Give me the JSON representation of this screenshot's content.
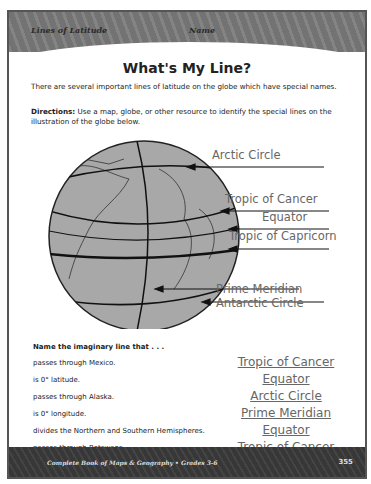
{
  "header": {
    "unit_label": "Lines of Latitude",
    "name_label": "Name"
  },
  "title": "What's My Line?",
  "intro": "There are several important lines of latitude on the globe which have special names.",
  "directions": {
    "label": "Directions:",
    "text": " Use a map, globe, or other resource to identify the special lines on the illustration of the globe below."
  },
  "globe_labels": [
    {
      "text": "Arctic Circle"
    },
    {
      "text": "Tropic of Cancer"
    },
    {
      "text": "Equator"
    },
    {
      "text": "Tropic of Capricorn"
    },
    {
      "text": "Prime Meridian"
    },
    {
      "text": "Antarctic Circle"
    }
  ],
  "questions": {
    "heading": "Name the imaginary line that . . .",
    "items": [
      {
        "prompt": "passes through Mexico.",
        "answer": "Tropic of Cancer"
      },
      {
        "prompt": "is 0° latitude.",
        "answer": "Equator"
      },
      {
        "prompt": "passes through Alaska.",
        "answer": "Arctic Circle"
      },
      {
        "prompt": "is 0° longitude.",
        "answer": "Prime Meridian"
      },
      {
        "prompt": "divides the Northern and Southern Hemispheres.",
        "answer": "Equator"
      },
      {
        "prompt": "passes through Botswana.",
        "answer": "Tropic of Cancer"
      }
    ]
  },
  "footer": {
    "book": "Complete Book of Maps & Geography • Grades 3-6",
    "page": "355"
  }
}
